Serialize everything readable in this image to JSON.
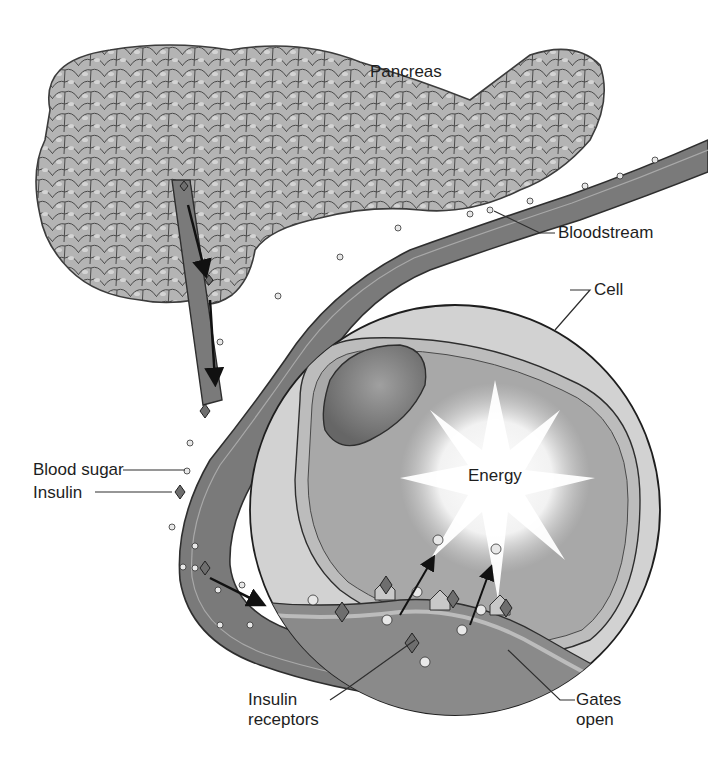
{
  "diagram": {
    "colors": {
      "background": "#ffffff",
      "pancreas_fill": "#b4b4b4",
      "pancreas_outline": "#3c3c3c",
      "vessel_fill": "#7a7a7a",
      "vessel_wall": "#a9a9a9",
      "cell_outer": "#d2d2d2",
      "cell_membrane": "#bcbcbc",
      "cytoplasm": "#a8a8a8",
      "nucleus": "#747474",
      "energy_burst": "#ffffff",
      "blood_sugar_dot": "#e8e8e8",
      "insulin_diamond": "#6e6e6e",
      "text": "#1e1e1e"
    },
    "labels": {
      "pancreas": "Pancreas",
      "bloodstream": "Bloodstream",
      "cell": "Cell",
      "blood_sugar": "Blood sugar",
      "insulin": "Insulin",
      "energy": "Energy",
      "insulin_receptors": "Insulin\nreceptors",
      "gates_open": "Gates\nopen"
    }
  }
}
